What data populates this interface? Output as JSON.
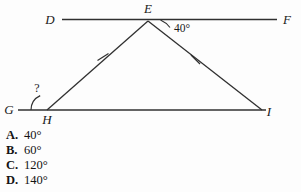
{
  "figure": {
    "points": {
      "D": {
        "label": "D",
        "x": 50,
        "y": 20
      },
      "E": {
        "label": "E",
        "x": 148,
        "y": 20
      },
      "F": {
        "label": "F",
        "x": 285,
        "y": 20
      },
      "G": {
        "label": "G",
        "x": 18,
        "y": 110
      },
      "H": {
        "label": "H",
        "x": 47,
        "y": 110
      },
      "I": {
        "label": "I",
        "x": 262,
        "y": 110
      }
    },
    "label_text": {
      "D": "D",
      "E": "E",
      "F": "F",
      "G": "G",
      "H": "H",
      "I": "I"
    },
    "known_angle": "40°",
    "unknown_angle": "?",
    "tick_marks": {
      "count_per_side": 1,
      "sides": [
        "EH",
        "EI"
      ],
      "meaning": "congruent-sides"
    },
    "lines": {
      "top": "DF",
      "bottom": "GI",
      "left_side": "EH",
      "right_side": "EI"
    },
    "stroke_color": "#303030"
  },
  "choices": [
    {
      "letter": "A.",
      "value": "40°"
    },
    {
      "letter": "B.",
      "value": "60°"
    },
    {
      "letter": "C.",
      "value": "120°"
    },
    {
      "letter": "D.",
      "value": "140°"
    }
  ]
}
